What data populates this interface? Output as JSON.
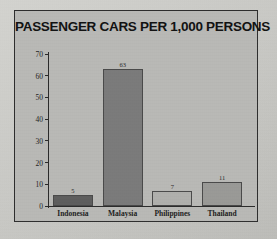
{
  "chart_data": {
    "type": "bar",
    "title": "PASSENGER CARS PER 1,000 PERSONS",
    "xlabel": "",
    "ylabel": "",
    "categories": [
      "Indonesia",
      "Malaysia",
      "Philippines",
      "Thailand"
    ],
    "values": [
      5,
      63,
      7,
      11
    ],
    "value_labels": [
      "5",
      "63",
      "7",
      "11"
    ],
    "ylim": [
      0,
      70
    ],
    "yticks": [
      0,
      10,
      20,
      30,
      40,
      50,
      60,
      70
    ],
    "ytick_labels": [
      "0",
      "10",
      "20",
      "30",
      "40",
      "50",
      "60",
      "70"
    ],
    "grid": false,
    "legend": false,
    "bar_colors": [
      "#5e5e5e",
      "#7b7b7b",
      "#b0b0ad",
      "#9a9a97"
    ],
    "panel_background": "#b9b9b6",
    "panel_border": "#2e2e2e",
    "axis_color": "#2b2b2b",
    "title_color": "#121212"
  }
}
